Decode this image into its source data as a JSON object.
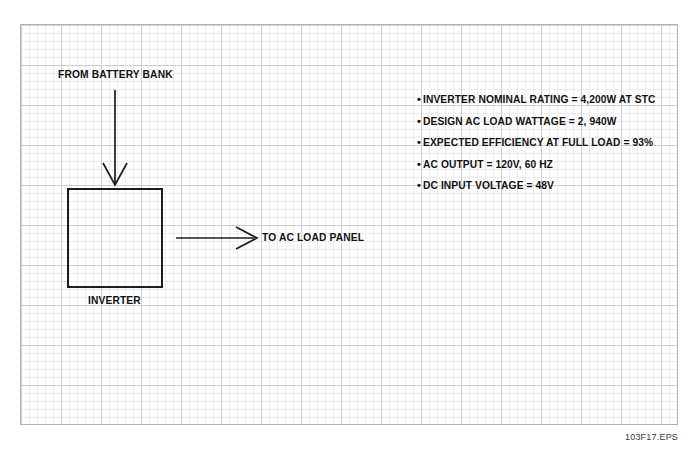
{
  "figure": {
    "id_caption": "103F17.EPS",
    "background": "#ffffff",
    "grid_minor_color": "#ededed",
    "grid_major_color": "#cfcfcf",
    "frame_color": "#b4b4b4",
    "ink_color": "#1c1c1c"
  },
  "labels": {
    "from_battery_bank": "FROM BATTERY BANK",
    "inverter": "INVERTER",
    "to_ac_load_panel": "TO AC LOAD PANEL"
  },
  "specs": {
    "items": [
      {
        "bullet": "•",
        "text": "INVERTER NOMINAL RATING = 4,200W AT STC"
      },
      {
        "bullet": "•",
        "text": "DESIGN AC LOAD WATTAGE = 2, 940W"
      },
      {
        "bullet": "•",
        "text": "EXPECTED EFFICIENCY AT FULL LOAD = 93%"
      },
      {
        "bullet": "•",
        "text": "AC OUTPUT = 120V, 60 HZ"
      },
      {
        "bullet": "•",
        "text": "DC INPUT VOLTAGE = 48V"
      }
    ]
  },
  "arrows": {
    "input_arrow": {
      "direction": "down",
      "x": 115,
      "y_start": 90,
      "y_end": 185
    },
    "output_arrow": {
      "direction": "right",
      "y": 238,
      "x_start": 176,
      "x_end": 257
    }
  }
}
